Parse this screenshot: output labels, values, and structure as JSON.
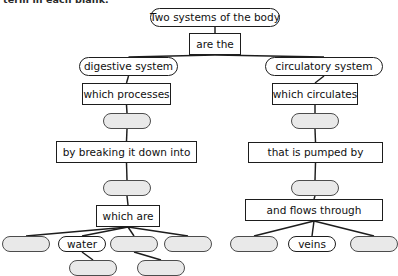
{
  "worksheet": {
    "instruction": "term in each blank.",
    "diagram_title": "Two systems of the body concept map"
  },
  "colors": {
    "page_background": "#ffffff",
    "stroke": "#1d1d1d",
    "blank_fill": "#e9e9e9",
    "blank_stroke": "#4c4c4c",
    "text": "#101010"
  },
  "chart_data": {
    "type": "diagram",
    "subtype": "concept-map",
    "title": "Two systems of the body",
    "nodes": [
      {
        "id": "root",
        "label": "Two systems of the body",
        "shape": "pill",
        "filled": true,
        "x": 150,
        "y": 8,
        "w": 130,
        "h": 19
      },
      {
        "id": "are-the",
        "label": "are the",
        "shape": "box",
        "filled": true,
        "x": 189,
        "y": 33,
        "w": 52,
        "h": 22
      },
      {
        "id": "digestive",
        "label": "digestive system",
        "shape": "pill",
        "filled": true,
        "x": 79,
        "y": 57,
        "w": 99,
        "h": 19
      },
      {
        "id": "circulatory",
        "label": "circulatory system",
        "shape": "pill",
        "filled": true,
        "x": 265,
        "y": 57,
        "w": 118,
        "h": 19
      },
      {
        "id": "which-processes",
        "label": "which processes",
        "shape": "box",
        "filled": true,
        "x": 82,
        "y": 83,
        "w": 89,
        "h": 22
      },
      {
        "id": "which-circulates",
        "label": "which circulates",
        "shape": "box",
        "filled": true,
        "x": 272,
        "y": 83,
        "w": 86,
        "h": 22
      },
      {
        "id": "blank-l1",
        "label": "",
        "shape": "pill",
        "filled": false,
        "x": 103,
        "y": 113,
        "w": 48,
        "h": 16
      },
      {
        "id": "blank-r1",
        "label": "",
        "shape": "pill",
        "filled": false,
        "x": 291,
        "y": 113,
        "w": 48,
        "h": 16
      },
      {
        "id": "by-breaking",
        "label": "by breaking it down into",
        "shape": "box",
        "filled": true,
        "x": 56,
        "y": 141,
        "w": 141,
        "h": 22
      },
      {
        "id": "that-is-pumped",
        "label": "that is pumped by",
        "shape": "box",
        "filled": true,
        "x": 248,
        "y": 142,
        "w": 135,
        "h": 21
      },
      {
        "id": "blank-l2",
        "label": "",
        "shape": "pill",
        "filled": false,
        "x": 103,
        "y": 180,
        "w": 48,
        "h": 16
      },
      {
        "id": "blank-r2",
        "label": "",
        "shape": "pill",
        "filled": false,
        "x": 291,
        "y": 180,
        "w": 48,
        "h": 16
      },
      {
        "id": "which-are",
        "label": "which are",
        "shape": "box",
        "filled": true,
        "x": 96,
        "y": 205,
        "w": 64,
        "h": 22
      },
      {
        "id": "and-flows",
        "label": "and flows through",
        "shape": "box",
        "filled": true,
        "x": 245,
        "y": 199,
        "w": 138,
        "h": 22
      },
      {
        "id": "blank-a",
        "label": "",
        "shape": "pill",
        "filled": false,
        "x": 2,
        "y": 236,
        "w": 48,
        "h": 16
      },
      {
        "id": "water",
        "label": "water",
        "shape": "pill",
        "filled": true,
        "x": 58,
        "y": 236,
        "w": 48,
        "h": 16
      },
      {
        "id": "blank-b",
        "label": "",
        "shape": "pill",
        "filled": false,
        "x": 110,
        "y": 236,
        "w": 48,
        "h": 16
      },
      {
        "id": "blank-c",
        "label": "",
        "shape": "pill",
        "filled": false,
        "x": 164,
        "y": 236,
        "w": 48,
        "h": 16
      },
      {
        "id": "blank-d",
        "label": "",
        "shape": "pill",
        "filled": false,
        "x": 69,
        "y": 260,
        "w": 48,
        "h": 16
      },
      {
        "id": "blank-e",
        "label": "",
        "shape": "pill",
        "filled": false,
        "x": 137,
        "y": 260,
        "w": 48,
        "h": 16
      },
      {
        "id": "blank-f",
        "label": "",
        "shape": "pill",
        "filled": false,
        "x": 230,
        "y": 236,
        "w": 48,
        "h": 16
      },
      {
        "id": "veins",
        "label": "veins",
        "shape": "pill",
        "filled": true,
        "x": 288,
        "y": 236,
        "w": 48,
        "h": 16
      },
      {
        "id": "blank-g",
        "label": "",
        "shape": "pill",
        "filled": false,
        "x": 350,
        "y": 236,
        "w": 48,
        "h": 16
      }
    ],
    "edges": [
      {
        "from": "root",
        "to": "are-the"
      },
      {
        "from": "are-the",
        "to": "digestive"
      },
      {
        "from": "are-the",
        "to": "circulatory"
      },
      {
        "from": "digestive",
        "to": "which-processes"
      },
      {
        "from": "circulatory",
        "to": "which-circulates"
      },
      {
        "from": "which-processes",
        "to": "blank-l1"
      },
      {
        "from": "which-circulates",
        "to": "blank-r1"
      },
      {
        "from": "blank-l1",
        "to": "by-breaking"
      },
      {
        "from": "blank-r1",
        "to": "that-is-pumped"
      },
      {
        "from": "by-breaking",
        "to": "blank-l2"
      },
      {
        "from": "that-is-pumped",
        "to": "blank-r2"
      },
      {
        "from": "blank-l2",
        "to": "which-are"
      },
      {
        "from": "blank-r2",
        "to": "and-flows"
      },
      {
        "from": "which-are",
        "to": "blank-a"
      },
      {
        "from": "which-are",
        "to": "water"
      },
      {
        "from": "which-are",
        "to": "blank-b"
      },
      {
        "from": "which-are",
        "to": "blank-c"
      },
      {
        "from": "water",
        "to": "blank-d"
      },
      {
        "from": "blank-b",
        "to": "blank-e"
      },
      {
        "from": "and-flows",
        "to": "blank-f"
      },
      {
        "from": "and-flows",
        "to": "veins"
      },
      {
        "from": "and-flows",
        "to": "blank-g"
      }
    ]
  }
}
